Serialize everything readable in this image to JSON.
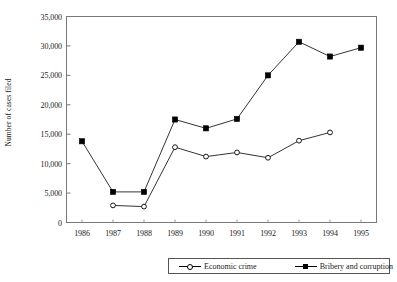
{
  "chart_data": {
    "type": "line",
    "title": "",
    "xlabel": "",
    "ylabel": "Number of cases filed",
    "categories": [
      "1986",
      "1987",
      "1988",
      "1989",
      "1990",
      "1991",
      "1992",
      "1993",
      "1994",
      "1995"
    ],
    "ylim": [
      0,
      35000
    ],
    "ytick_labels": [
      "0",
      "5,000",
      "10,000",
      "15,000",
      "20,000",
      "25,000",
      "30,000",
      "35,000"
    ],
    "ytick_values": [
      0,
      5000,
      10000,
      15000,
      20000,
      25000,
      30000,
      35000
    ],
    "grid": false,
    "legend_position": "bottom",
    "series": [
      {
        "name": "Economic crime",
        "marker": "open-circle",
        "color": "#000000",
        "x": [
          "1987",
          "1988",
          "1989",
          "1990",
          "1991",
          "1992",
          "1993",
          "1994"
        ],
        "values": [
          2900,
          2700,
          12800,
          11200,
          11900,
          11000,
          13900,
          15300
        ]
      },
      {
        "name": "Bribery and corruption",
        "marker": "filled-square",
        "color": "#000000",
        "x": [
          "1986",
          "1987",
          "1988",
          "1989",
          "1990",
          "1991",
          "1992",
          "1993",
          "1994",
          "1995"
        ],
        "values": [
          13800,
          5200,
          5200,
          17500,
          16000,
          17600,
          25000,
          30700,
          28200,
          29700
        ]
      }
    ]
  },
  "axis": {
    "y_title": "Number of cases filed"
  },
  "legend": {
    "economic_crime_label": "Economic crime",
    "bribery_label": "Bribery and corruption"
  }
}
